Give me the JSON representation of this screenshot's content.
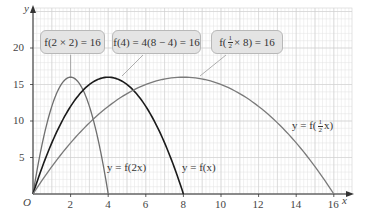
{
  "chart_data": {
    "type": "line",
    "title": "",
    "xlabel": "x",
    "ylabel": "y",
    "origin_label": "O",
    "xlim": [
      0,
      17
    ],
    "ylim": [
      0,
      22
    ],
    "x_ticks": [
      2,
      4,
      6,
      8,
      10,
      12,
      14,
      16
    ],
    "y_ticks": [
      5,
      10,
      15,
      20
    ],
    "grid": true,
    "series": [
      {
        "name": "y = f(2x)",
        "formula": "8x(4-x) on [0,4]",
        "color": "#6e6e6e",
        "x": [
          0,
          0.5,
          1,
          1.5,
          2,
          2.5,
          3,
          3.5,
          4
        ],
        "y": [
          0,
          7,
          12,
          15,
          16,
          15,
          12,
          7,
          0
        ]
      },
      {
        "name": "y = f(x)",
        "formula": "x(8-x) on [0,8]",
        "color": "#1a1a1a",
        "x": [
          0,
          1,
          2,
          3,
          4,
          5,
          6,
          7,
          8
        ],
        "y": [
          0,
          7,
          12,
          15,
          16,
          15,
          12,
          7,
          0
        ]
      },
      {
        "name": "y = f(1/2 x)",
        "formula": "(x/2)(8-x/2) on [0,16]",
        "color": "#7a7a7a",
        "x": [
          0,
          2,
          4,
          6,
          8,
          10,
          12,
          14,
          16
        ],
        "y": [
          0,
          7,
          12,
          15,
          16,
          15,
          12,
          7,
          0
        ]
      }
    ],
    "annotations": [
      {
        "text": "f(2 × 2) = 16",
        "points_to": [
          2,
          16
        ]
      },
      {
        "text": "f(4) = 4(8 − 4) = 16",
        "points_to": [
          4,
          16
        ]
      },
      {
        "text": "f(½ × 8) = 16",
        "points_to": [
          8,
          16
        ]
      }
    ]
  },
  "labels": {
    "axis_x": "x",
    "axis_y": "y",
    "origin": "O",
    "curve_f2x": "y = f(2x)",
    "curve_fx": "y = f(x)",
    "curve_fhalf_prefix": "y = f(",
    "curve_fhalf_num": "1",
    "curve_fhalf_den": "2",
    "curve_fhalf_suffix": "x)",
    "callout1": "f(2 × 2) = 16",
    "callout2": "f(4) = 4(8 − 4) = 16",
    "callout3_prefix": "f(",
    "callout3_num": "1",
    "callout3_den": "2",
    "callout3_suffix": " × 8) = 16",
    "xt": [
      "2",
      "4",
      "6",
      "8",
      "10",
      "12",
      "14",
      "16"
    ],
    "yt": [
      "5",
      "10",
      "15",
      "20"
    ]
  }
}
